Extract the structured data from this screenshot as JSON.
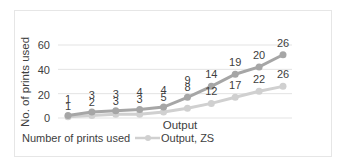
{
  "chart_data": {
    "type": "line",
    "stacked": true,
    "title": "",
    "xlabel": "Output",
    "ylabel": "No. of prints used",
    "ylim": [
      0,
      60
    ],
    "yticks": [
      0,
      20,
      40,
      60
    ],
    "grid": true,
    "legend_position": "bottom",
    "categories": [
      1,
      2,
      3,
      4,
      5,
      6,
      7,
      8,
      9,
      10
    ],
    "series": [
      {
        "name": "Number of prints used",
        "color": "#a6a6a6",
        "values": [
          1,
          3,
          3,
          4,
          4,
          9,
          14,
          19,
          20,
          26
        ]
      },
      {
        "name": "Output, ZS",
        "color": "#d0d0d0",
        "values": [
          1,
          2,
          3,
          3,
          5,
          8,
          12,
          17,
          22,
          26
        ]
      }
    ]
  },
  "labels": {
    "ylabel": "No. of prints used",
    "xlabel": "Output",
    "legend_series1": "Number of prints used",
    "legend_series2": "Output, ZS",
    "ytick_0": "0",
    "ytick_20": "20",
    "ytick_40": "40",
    "ytick_60": "60"
  }
}
